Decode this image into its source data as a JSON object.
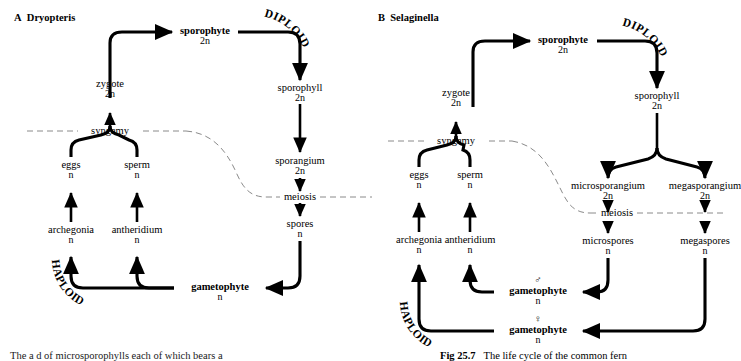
{
  "figure": {
    "caption_label": "Fig 25.7",
    "caption_text": "The life cycle of the common fern",
    "left_fragment": "The a d of microsporophylls each of which bears a"
  },
  "panels": [
    {
      "id": "A",
      "letter": "A",
      "organism": "Dryopteris",
      "phase_labels": {
        "diploid": "DIPLOID",
        "haploid": "HAPLOID"
      },
      "boundary_labels": {
        "syngamy": "syngamy",
        "meiosis": "meiosis"
      },
      "nodes": [
        {
          "key": "sporophyte",
          "label": "sporophyte",
          "ploidy": "2n",
          "bold": true,
          "sex": ""
        },
        {
          "key": "zygote",
          "label": "zygote",
          "ploidy": "2n",
          "bold": false,
          "sex": ""
        },
        {
          "key": "sporophyll",
          "label": "sporophyll",
          "ploidy": "2n",
          "bold": false,
          "sex": ""
        },
        {
          "key": "sporangium",
          "label": "sporangium",
          "ploidy": "2n",
          "bold": false,
          "sex": ""
        },
        {
          "key": "spores",
          "label": "spores",
          "ploidy": "n",
          "bold": false,
          "sex": ""
        },
        {
          "key": "eggs",
          "label": "eggs",
          "ploidy": "n",
          "bold": false,
          "sex": ""
        },
        {
          "key": "sperm",
          "label": "sperm",
          "ploidy": "n",
          "bold": false,
          "sex": ""
        },
        {
          "key": "archegonia",
          "label": "archegonia",
          "ploidy": "n",
          "bold": false,
          "sex": ""
        },
        {
          "key": "antheridium",
          "label": "antheridium",
          "ploidy": "n",
          "bold": false,
          "sex": ""
        },
        {
          "key": "gametophyte",
          "label": "gametophyte",
          "ploidy": "n",
          "bold": true,
          "sex": ""
        }
      ]
    },
    {
      "id": "B",
      "letter": "B",
      "organism": "Selaginella",
      "phase_labels": {
        "diploid": "DIPLOID",
        "haploid": "HAPLOID"
      },
      "boundary_labels": {
        "syngamy": "syngamy",
        "meiosis": "meiosis"
      },
      "nodes": [
        {
          "key": "sporophyte",
          "label": "sporophyte",
          "ploidy": "2n",
          "bold": true,
          "sex": ""
        },
        {
          "key": "zygote",
          "label": "zygote",
          "ploidy": "2n",
          "bold": false,
          "sex": ""
        },
        {
          "key": "sporophyll",
          "label": "sporophyll",
          "ploidy": "2n",
          "bold": false,
          "sex": ""
        },
        {
          "key": "microsporangium",
          "label": "microsporangium",
          "ploidy": "2n",
          "bold": false,
          "sex": ""
        },
        {
          "key": "megasporangium",
          "label": "megasporangium",
          "ploidy": "2n",
          "bold": false,
          "sex": ""
        },
        {
          "key": "microspores",
          "label": "microspores",
          "ploidy": "n",
          "bold": false,
          "sex": ""
        },
        {
          "key": "megaspores",
          "label": "megaspores",
          "ploidy": "n",
          "bold": false,
          "sex": ""
        },
        {
          "key": "eggs",
          "label": "eggs",
          "ploidy": "n",
          "bold": false,
          "sex": ""
        },
        {
          "key": "sperm",
          "label": "sperm",
          "ploidy": "n",
          "bold": false,
          "sex": ""
        },
        {
          "key": "archegonia",
          "label": "archegonia",
          "ploidy": "n",
          "bold": false,
          "sex": ""
        },
        {
          "key": "antheridium",
          "label": "antheridium",
          "ploidy": "n",
          "bold": false,
          "sex": ""
        },
        {
          "key": "gametophyte_male",
          "label": "gametophyte",
          "ploidy": "n",
          "bold": true,
          "sex": "♂"
        },
        {
          "key": "gametophyte_female",
          "label": "gametophyte",
          "ploidy": "n",
          "bold": true,
          "sex": "♀"
        }
      ]
    }
  ],
  "colors": {
    "ink": "#000000",
    "boundary": "#8a8a8a"
  }
}
